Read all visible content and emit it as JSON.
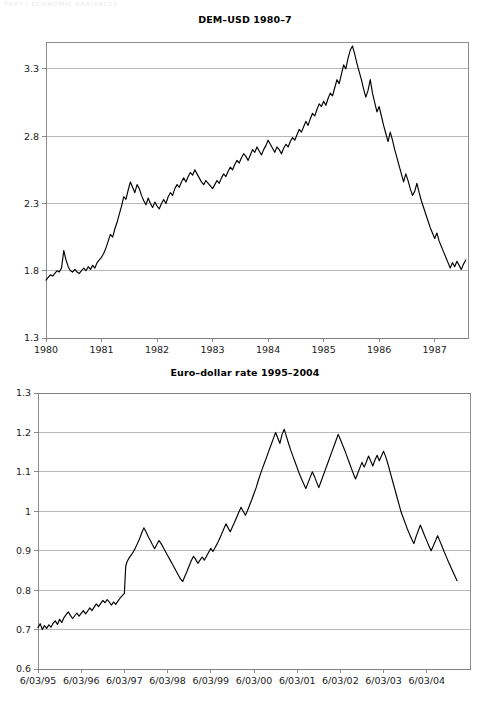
{
  "running_head": "PART I  ECONOMIC VARIABLES",
  "figures": [
    {
      "id": "dem-usd",
      "title": "DEM–USD 1980–7"
    },
    {
      "id": "euro-dollar",
      "title": "Euro–dollar rate 1995–2004"
    }
  ],
  "chart_data": [
    {
      "type": "line",
      "title": "DEM–USD 1980–7",
      "xlabel": "",
      "ylabel": "",
      "grid": true,
      "legend": null,
      "line_color": "#000000",
      "axis_color": "#808080",
      "grid_color": "#a6a6a6",
      "xlim": [
        1980.0,
        1987.6
      ],
      "ylim": [
        1.3,
        3.5
      ],
      "yticks": [
        "1.3",
        "1.8",
        "2.3",
        "2.8",
        "3.3"
      ],
      "ytick_values": [
        1.3,
        1.8,
        2.3,
        2.8,
        3.3
      ],
      "xticks": [
        "1980",
        "1981",
        "1982",
        "1983",
        "1984",
        "1985",
        "1986",
        "1987"
      ],
      "xtick_values": [
        1980,
        1981,
        1982,
        1983,
        1984,
        1985,
        1986,
        1987
      ],
      "x": [
        1980.0,
        1980.04,
        1980.08,
        1980.12,
        1980.16,
        1980.2,
        1980.24,
        1980.28,
        1980.32,
        1980.36,
        1980.4,
        1980.44,
        1980.48,
        1980.52,
        1980.56,
        1980.6,
        1980.64,
        1980.68,
        1980.72,
        1980.76,
        1980.8,
        1980.84,
        1980.88,
        1980.92,
        1980.96,
        1981.0,
        1981.04,
        1981.08,
        1981.12,
        1981.16,
        1981.2,
        1981.24,
        1981.28,
        1981.32,
        1981.36,
        1981.4,
        1981.44,
        1981.48,
        1981.52,
        1981.56,
        1981.6,
        1981.64,
        1981.68,
        1981.72,
        1981.76,
        1981.8,
        1981.84,
        1981.88,
        1981.92,
        1981.96,
        1982.0,
        1982.04,
        1982.08,
        1982.12,
        1982.16,
        1982.2,
        1982.24,
        1982.28,
        1982.32,
        1982.36,
        1982.4,
        1982.44,
        1982.48,
        1982.52,
        1982.56,
        1982.6,
        1982.64,
        1982.68,
        1982.72,
        1982.76,
        1982.8,
        1982.84,
        1982.88,
        1982.92,
        1982.96,
        1983.0,
        1983.04,
        1983.08,
        1983.12,
        1983.16,
        1983.2,
        1983.24,
        1983.28,
        1983.32,
        1983.36,
        1983.4,
        1983.44,
        1983.48,
        1983.52,
        1983.56,
        1983.6,
        1983.64,
        1983.68,
        1983.72,
        1983.76,
        1983.8,
        1983.84,
        1983.88,
        1983.92,
        1983.96,
        1984.0,
        1984.04,
        1984.08,
        1984.12,
        1984.16,
        1984.2,
        1984.24,
        1984.28,
        1984.32,
        1984.36,
        1984.4,
        1984.44,
        1984.48,
        1984.52,
        1984.56,
        1984.6,
        1984.64,
        1984.68,
        1984.72,
        1984.76,
        1984.8,
        1984.84,
        1984.88,
        1984.92,
        1984.96,
        1985.0,
        1985.04,
        1985.08,
        1985.12,
        1985.16,
        1985.2,
        1985.24,
        1985.28,
        1985.32,
        1985.36,
        1985.4,
        1985.44,
        1985.48,
        1985.52,
        1985.56,
        1985.6,
        1985.64,
        1985.68,
        1985.72,
        1985.76,
        1985.8,
        1985.84,
        1985.88,
        1985.92,
        1985.96,
        1986.0,
        1986.04,
        1986.08,
        1986.12,
        1986.16,
        1986.2,
        1986.24,
        1986.28,
        1986.32,
        1986.36,
        1986.4,
        1986.44,
        1986.48,
        1986.52,
        1986.56,
        1986.6,
        1986.64,
        1986.68,
        1986.72,
        1986.76,
        1986.8,
        1986.84,
        1986.88,
        1986.92,
        1986.96,
        1987.0,
        1987.04,
        1987.08,
        1987.12,
        1987.16,
        1987.2,
        1987.24,
        1987.28,
        1987.32,
        1987.36,
        1987.4,
        1987.44,
        1987.48,
        1987.52,
        1987.56
      ],
      "y": [
        1.73,
        1.75,
        1.77,
        1.76,
        1.78,
        1.8,
        1.79,
        1.82,
        1.95,
        1.88,
        1.83,
        1.8,
        1.79,
        1.81,
        1.79,
        1.78,
        1.8,
        1.82,
        1.8,
        1.83,
        1.81,
        1.84,
        1.82,
        1.86,
        1.88,
        1.9,
        1.93,
        1.97,
        2.02,
        2.07,
        2.05,
        2.11,
        2.16,
        2.22,
        2.28,
        2.35,
        2.33,
        2.4,
        2.46,
        2.42,
        2.38,
        2.44,
        2.41,
        2.36,
        2.32,
        2.29,
        2.34,
        2.3,
        2.27,
        2.31,
        2.28,
        2.26,
        2.3,
        2.33,
        2.3,
        2.35,
        2.38,
        2.36,
        2.41,
        2.44,
        2.42,
        2.46,
        2.49,
        2.46,
        2.5,
        2.53,
        2.51,
        2.55,
        2.52,
        2.49,
        2.46,
        2.44,
        2.47,
        2.45,
        2.43,
        2.41,
        2.44,
        2.47,
        2.45,
        2.49,
        2.52,
        2.5,
        2.54,
        2.57,
        2.55,
        2.59,
        2.62,
        2.6,
        2.64,
        2.67,
        2.65,
        2.62,
        2.66,
        2.7,
        2.68,
        2.72,
        2.69,
        2.66,
        2.7,
        2.73,
        2.77,
        2.74,
        2.71,
        2.68,
        2.72,
        2.7,
        2.67,
        2.71,
        2.74,
        2.72,
        2.76,
        2.79,
        2.77,
        2.81,
        2.85,
        2.83,
        2.87,
        2.91,
        2.88,
        2.93,
        2.97,
        2.95,
        3.0,
        3.04,
        3.02,
        3.06,
        3.03,
        3.08,
        3.12,
        3.1,
        3.16,
        3.22,
        3.19,
        3.26,
        3.33,
        3.3,
        3.38,
        3.44,
        3.47,
        3.41,
        3.34,
        3.28,
        3.22,
        3.15,
        3.09,
        3.14,
        3.22,
        3.12,
        3.05,
        2.98,
        3.02,
        2.95,
        2.88,
        2.82,
        2.76,
        2.83,
        2.77,
        2.7,
        2.64,
        2.58,
        2.52,
        2.46,
        2.52,
        2.47,
        2.41,
        2.36,
        2.39,
        2.45,
        2.38,
        2.32,
        2.27,
        2.22,
        2.17,
        2.12,
        2.08,
        2.04,
        2.08,
        2.02,
        1.98,
        1.94,
        1.9,
        1.86,
        1.82,
        1.86,
        1.83,
        1.87,
        1.84,
        1.81,
        1.85,
        1.88,
        1.86,
        1.84,
        1.87,
        1.86,
        1.88
      ]
    },
    {
      "type": "line",
      "title": "Euro–dollar rate 1995–2004",
      "xlabel": "",
      "ylabel": "",
      "grid": true,
      "legend": null,
      "line_color": "#000000",
      "axis_color": "#808080",
      "grid_color": "#a6a6a6",
      "xlim": [
        0,
        10.0
      ],
      "ylim": [
        0.6,
        1.3
      ],
      "yticks": [
        "0.6",
        "0.7",
        "0.8",
        "0.9",
        "1",
        "1.1",
        "1.2",
        "1.3"
      ],
      "ytick_values": [
        0.6,
        0.7,
        0.8,
        0.9,
        1.0,
        1.1,
        1.2,
        1.3
      ],
      "xticks": [
        "6/03/95",
        "6/03/96",
        "6/03/97",
        "6/03/98",
        "6/03/99",
        "6/03/00",
        "6/03/01",
        "6/03/02",
        "6/03/03",
        "6/03/04"
      ],
      "xtick_values": [
        0,
        1,
        2,
        3,
        4,
        5,
        6,
        7,
        8,
        9
      ],
      "x": [
        0.0,
        0.05,
        0.1,
        0.15,
        0.2,
        0.25,
        0.3,
        0.35,
        0.4,
        0.45,
        0.5,
        0.55,
        0.6,
        0.65,
        0.7,
        0.75,
        0.8,
        0.85,
        0.9,
        0.95,
        1.0,
        1.05,
        1.1,
        1.15,
        1.2,
        1.25,
        1.3,
        1.35,
        1.4,
        1.45,
        1.5,
        1.55,
        1.6,
        1.65,
        1.7,
        1.75,
        1.8,
        1.85,
        1.9,
        1.95,
        2.0,
        2.03,
        2.06,
        2.1,
        2.15,
        2.2,
        2.25,
        2.3,
        2.35,
        2.4,
        2.45,
        2.5,
        2.55,
        2.6,
        2.65,
        2.7,
        2.75,
        2.8,
        2.85,
        2.9,
        2.95,
        3.0,
        3.05,
        3.1,
        3.15,
        3.2,
        3.25,
        3.3,
        3.35,
        3.4,
        3.45,
        3.5,
        3.55,
        3.6,
        3.65,
        3.7,
        3.75,
        3.8,
        3.85,
        3.9,
        3.95,
        4.0,
        4.05,
        4.1,
        4.15,
        4.2,
        4.25,
        4.3,
        4.35,
        4.4,
        4.45,
        4.5,
        4.55,
        4.6,
        4.65,
        4.7,
        4.75,
        4.8,
        4.85,
        4.9,
        4.95,
        5.0,
        5.05,
        5.1,
        5.15,
        5.2,
        5.25,
        5.3,
        5.35,
        5.4,
        5.45,
        5.5,
        5.55,
        5.6,
        5.65,
        5.7,
        5.75,
        5.8,
        5.85,
        5.9,
        5.95,
        6.0,
        6.05,
        6.1,
        6.15,
        6.2,
        6.25,
        6.3,
        6.35,
        6.4,
        6.45,
        6.5,
        6.55,
        6.6,
        6.65,
        6.7,
        6.75,
        6.8,
        6.85,
        6.9,
        6.95,
        7.0,
        7.05,
        7.1,
        7.15,
        7.2,
        7.25,
        7.3,
        7.35,
        7.4,
        7.45,
        7.5,
        7.55,
        7.6,
        7.65,
        7.7,
        7.75,
        7.8,
        7.85,
        7.9,
        7.95,
        8.0,
        8.05,
        8.1,
        8.15,
        8.2,
        8.25,
        8.3,
        8.35,
        8.4,
        8.45,
        8.5,
        8.55,
        8.6,
        8.65,
        8.7,
        8.75,
        8.8,
        8.85,
        8.9,
        8.95,
        9.0,
        9.05,
        9.1,
        9.15,
        9.2,
        9.25,
        9.3,
        9.35,
        9.4,
        9.45,
        9.5,
        9.55,
        9.6,
        9.65,
        9.7
      ],
      "y": [
        0.705,
        0.715,
        0.7,
        0.71,
        0.703,
        0.712,
        0.706,
        0.716,
        0.722,
        0.713,
        0.726,
        0.718,
        0.73,
        0.738,
        0.745,
        0.736,
        0.728,
        0.735,
        0.742,
        0.734,
        0.741,
        0.748,
        0.74,
        0.747,
        0.755,
        0.748,
        0.757,
        0.765,
        0.758,
        0.766,
        0.774,
        0.768,
        0.776,
        0.77,
        0.762,
        0.77,
        0.764,
        0.772,
        0.78,
        0.786,
        0.792,
        0.86,
        0.872,
        0.88,
        0.888,
        0.896,
        0.906,
        0.918,
        0.93,
        0.945,
        0.958,
        0.948,
        0.936,
        0.926,
        0.915,
        0.905,
        0.916,
        0.926,
        0.918,
        0.908,
        0.898,
        0.888,
        0.878,
        0.868,
        0.858,
        0.848,
        0.838,
        0.828,
        0.822,
        0.835,
        0.848,
        0.862,
        0.875,
        0.886,
        0.878,
        0.868,
        0.876,
        0.884,
        0.876,
        0.886,
        0.896,
        0.906,
        0.898,
        0.908,
        0.918,
        0.93,
        0.942,
        0.955,
        0.968,
        0.958,
        0.948,
        0.96,
        0.972,
        0.985,
        0.998,
        1.01,
        1.0,
        0.99,
        1.002,
        1.016,
        1.03,
        1.045,
        1.06,
        1.078,
        1.095,
        1.11,
        1.125,
        1.14,
        1.155,
        1.17,
        1.185,
        1.2,
        1.186,
        1.172,
        1.195,
        1.208,
        1.19,
        1.172,
        1.155,
        1.14,
        1.125,
        1.11,
        1.095,
        1.082,
        1.07,
        1.058,
        1.072,
        1.086,
        1.1,
        1.088,
        1.074,
        1.06,
        1.075,
        1.09,
        1.105,
        1.12,
        1.135,
        1.15,
        1.165,
        1.18,
        1.195,
        1.182,
        1.168,
        1.155,
        1.14,
        1.125,
        1.11,
        1.095,
        1.082,
        1.096,
        1.11,
        1.124,
        1.112,
        1.125,
        1.14,
        1.128,
        1.115,
        1.13,
        1.142,
        1.128,
        1.14,
        1.152,
        1.138,
        1.12,
        1.1,
        1.08,
        1.06,
        1.04,
        1.02,
        1.0,
        0.985,
        0.97,
        0.955,
        0.942,
        0.93,
        0.918,
        0.935,
        0.95,
        0.965,
        0.952,
        0.938,
        0.925,
        0.912,
        0.9,
        0.912,
        0.925,
        0.938,
        0.925,
        0.912,
        0.898,
        0.885,
        0.872,
        0.86,
        0.848,
        0.836,
        0.824,
        0.812,
        0.8,
        0.812,
        0.826,
        0.84,
        0.832,
        0.822,
        0.836,
        0.828,
        0.84,
        0.832,
        0.842,
        0.83,
        0.818,
        0.83,
        0.84,
        0.828,
        0.816,
        0.804,
        0.792,
        0.78,
        0.768,
        0.756
      ]
    }
  ]
}
